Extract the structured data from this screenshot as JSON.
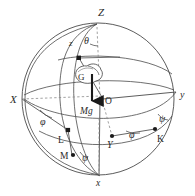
{
  "figure": {
    "name": "spinning-top-euler-angles-sphere-diagram",
    "type": "line-diagram",
    "width": 195,
    "height": 196,
    "background_color": "#ffffff",
    "stroke_color": "#4a4a4a",
    "dashed_color": "#7a7a7a",
    "text_color": "#2a2a2a",
    "marker_color": "#1a1a1a"
  },
  "labels": {
    "Z": "Z",
    "z": "z",
    "X": "X",
    "x": "x",
    "Y": "Y",
    "y": "y",
    "O": "O",
    "G": "G",
    "K": "K",
    "L": "L",
    "M": "M",
    "Mg": "Mg",
    "theta": "θ",
    "phi_left": "φ",
    "phi_right": "φ",
    "psi_right": "ψ",
    "psi_bottom": "ψ"
  },
  "label_positions": {
    "Z": {
      "x": 98,
      "y": 16
    },
    "z": {
      "x": 69,
      "y": 46
    },
    "X": {
      "x": 10,
      "y": 101
    },
    "x": {
      "x": 99,
      "y": 183
    },
    "Y": {
      "x": 110,
      "y": 145
    },
    "y": {
      "x": 181,
      "y": 98
    },
    "O": {
      "x": 108,
      "y": 102
    },
    "G": {
      "x": 81,
      "y": 82
    },
    "K": {
      "x": 158,
      "y": 139
    },
    "L": {
      "x": 60,
      "y": 139
    },
    "M": {
      "x": 64,
      "y": 158
    },
    "Mg": {
      "x": 84,
      "y": 112
    },
    "theta": {
      "x": 87,
      "y": 42
    },
    "phi_left": {
      "x": 44,
      "y": 122
    },
    "phi_right": {
      "x": 133,
      "y": 135
    },
    "psi_right": {
      "x": 163,
      "y": 119
    },
    "psi_bottom": {
      "x": 86,
      "y": 158
    }
  },
  "points": {
    "O": {
      "x": 103,
      "y": 99
    },
    "z_node": {
      "x": 79,
      "y": 58
    },
    "Y_node": {
      "x": 112,
      "y": 136
    },
    "K_node": {
      "x": 155,
      "y": 129
    },
    "L_node": {
      "x": 68,
      "y": 130
    },
    "M_node": {
      "x": 72,
      "y": 155
    },
    "Z_top": {
      "x": 97,
      "y": 26
    },
    "x_bottom": {
      "x": 100,
      "y": 176
    },
    "X_left": {
      "x": 22,
      "y": 99
    },
    "y_right": {
      "x": 176,
      "y": 92
    }
  },
  "sphere": {
    "cx": 98,
    "cy": 99,
    "r": 76,
    "description": "great circle sphere outline"
  },
  "force_arrow": {
    "label": "Mg",
    "from": {
      "x": 92,
      "y": 79
    },
    "to": {
      "x": 92,
      "y": 104
    },
    "direction": "down"
  },
  "top_body": {
    "label": "G",
    "description": "spinning top disk at center of mass",
    "cx": 88,
    "cy": 76,
    "rx": 12,
    "ry": 8
  },
  "angles": [
    {
      "name": "theta",
      "symbol": "θ",
      "between": "Z axis and z axis"
    },
    {
      "name": "phi",
      "symbol": "φ",
      "between": "X axis and line of nodes"
    },
    {
      "name": "psi",
      "symbol": "ψ",
      "between": "line of nodes and body x axis"
    }
  ]
}
